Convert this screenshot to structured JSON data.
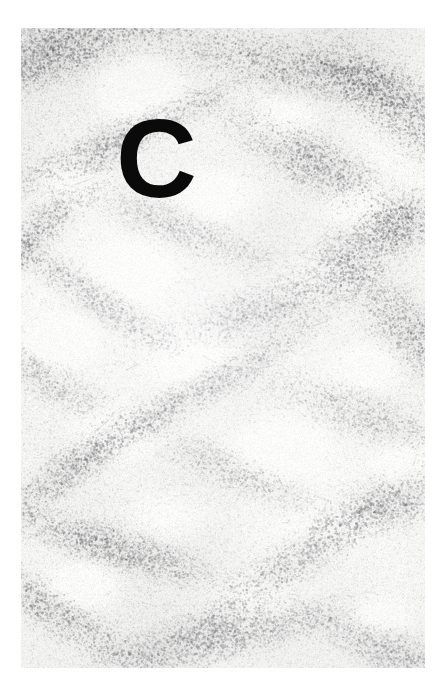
{
  "figure": {
    "domain": "micrograph",
    "panel_label": "C",
    "background_color": "#ffffff",
    "plate": {
      "x": 21,
      "y": 28,
      "width": 404,
      "height": 640,
      "base_color": "#f4f4f3",
      "stipple_color": "#6e6e6e",
      "band_color": "#9a9a9a"
    },
    "label_style": {
      "color": "#0a0a0a",
      "font_size_px": 112,
      "x": 116,
      "y": 104
    }
  },
  "texture": {
    "type": "stipple",
    "seed": 20240517,
    "dot_count": 120000,
    "dot_radius_min": 0.35,
    "dot_radius_max": 1.35,
    "base_alpha": 0.22,
    "bands": [
      {
        "cx": 0.1,
        "cy": 0.03,
        "rx": 0.52,
        "ry": 0.075,
        "rot": -12,
        "strength": 0.85
      },
      {
        "cx": 0.62,
        "cy": 0.055,
        "rx": 0.46,
        "ry": 0.065,
        "rot": 8,
        "strength": 0.7
      },
      {
        "cx": 0.93,
        "cy": 0.12,
        "rx": 0.3,
        "ry": 0.09,
        "rot": 26,
        "strength": 0.75
      },
      {
        "cx": 0.24,
        "cy": 0.175,
        "rx": 0.4,
        "ry": 0.045,
        "rot": -16,
        "strength": 0.8
      },
      {
        "cx": 0.74,
        "cy": 0.215,
        "rx": 0.38,
        "ry": 0.07,
        "rot": 20,
        "strength": 0.72
      },
      {
        "cx": 0.07,
        "cy": 0.3,
        "rx": 0.26,
        "ry": 0.055,
        "rot": -30,
        "strength": 0.68
      },
      {
        "cx": 0.4,
        "cy": 0.315,
        "rx": 0.34,
        "ry": 0.05,
        "rot": 14,
        "strength": 0.6
      },
      {
        "cx": 0.88,
        "cy": 0.33,
        "rx": 0.32,
        "ry": 0.07,
        "rot": -18,
        "strength": 0.78
      },
      {
        "cx": 0.18,
        "cy": 0.42,
        "rx": 0.36,
        "ry": 0.048,
        "rot": 22,
        "strength": 0.7
      },
      {
        "cx": 0.58,
        "cy": 0.445,
        "rx": 0.4,
        "ry": 0.058,
        "rot": -10,
        "strength": 0.66
      },
      {
        "cx": 0.95,
        "cy": 0.47,
        "rx": 0.26,
        "ry": 0.08,
        "rot": 30,
        "strength": 0.64
      },
      {
        "cx": 0.05,
        "cy": 0.545,
        "rx": 0.3,
        "ry": 0.05,
        "rot": 18,
        "strength": 0.62
      },
      {
        "cx": 0.45,
        "cy": 0.565,
        "rx": 0.42,
        "ry": 0.045,
        "rot": -20,
        "strength": 0.74
      },
      {
        "cx": 0.82,
        "cy": 0.6,
        "rx": 0.34,
        "ry": 0.062,
        "rot": 12,
        "strength": 0.58
      },
      {
        "cx": 0.14,
        "cy": 0.68,
        "rx": 0.34,
        "ry": 0.055,
        "rot": -24,
        "strength": 0.7
      },
      {
        "cx": 0.55,
        "cy": 0.7,
        "rx": 0.3,
        "ry": 0.05,
        "rot": 16,
        "strength": 0.6
      },
      {
        "cx": 0.9,
        "cy": 0.745,
        "rx": 0.28,
        "ry": 0.07,
        "rot": -14,
        "strength": 0.72
      },
      {
        "cx": 0.22,
        "cy": 0.81,
        "rx": 0.38,
        "ry": 0.052,
        "rot": 10,
        "strength": 0.76
      },
      {
        "cx": 0.66,
        "cy": 0.84,
        "rx": 0.36,
        "ry": 0.06,
        "rot": -22,
        "strength": 0.68
      },
      {
        "cx": 0.08,
        "cy": 0.91,
        "rx": 0.32,
        "ry": 0.058,
        "rot": 20,
        "strength": 0.74
      },
      {
        "cx": 0.5,
        "cy": 0.95,
        "rx": 0.44,
        "ry": 0.06,
        "rot": -8,
        "strength": 0.8
      },
      {
        "cx": 0.92,
        "cy": 0.975,
        "rx": 0.3,
        "ry": 0.055,
        "rot": 14,
        "strength": 0.7
      }
    ],
    "pale_foci": [
      {
        "cx": 0.3,
        "cy": 0.1,
        "rx": 0.17,
        "ry": 0.075
      },
      {
        "cx": 0.66,
        "cy": 0.14,
        "rx": 0.13,
        "ry": 0.055
      },
      {
        "cx": 0.12,
        "cy": 0.24,
        "rx": 0.14,
        "ry": 0.06
      },
      {
        "cx": 0.5,
        "cy": 0.26,
        "rx": 0.16,
        "ry": 0.065
      },
      {
        "cx": 0.84,
        "cy": 0.275,
        "rx": 0.13,
        "ry": 0.05
      },
      {
        "cx": 0.28,
        "cy": 0.375,
        "rx": 0.17,
        "ry": 0.07
      },
      {
        "cx": 0.7,
        "cy": 0.395,
        "rx": 0.15,
        "ry": 0.06
      },
      {
        "cx": 0.1,
        "cy": 0.49,
        "rx": 0.13,
        "ry": 0.055
      },
      {
        "cx": 0.44,
        "cy": 0.505,
        "rx": 0.18,
        "ry": 0.072
      },
      {
        "cx": 0.86,
        "cy": 0.53,
        "rx": 0.14,
        "ry": 0.058
      },
      {
        "cx": 0.24,
        "cy": 0.63,
        "rx": 0.16,
        "ry": 0.065
      },
      {
        "cx": 0.62,
        "cy": 0.655,
        "rx": 0.17,
        "ry": 0.07
      },
      {
        "cx": 0.94,
        "cy": 0.68,
        "rx": 0.12,
        "ry": 0.055
      },
      {
        "cx": 0.38,
        "cy": 0.76,
        "rx": 0.15,
        "ry": 0.062
      },
      {
        "cx": 0.78,
        "cy": 0.78,
        "rx": 0.16,
        "ry": 0.058
      },
      {
        "cx": 0.16,
        "cy": 0.87,
        "rx": 0.14,
        "ry": 0.055
      },
      {
        "cx": 0.56,
        "cy": 0.89,
        "rx": 0.15,
        "ry": 0.06
      },
      {
        "cx": 0.88,
        "cy": 0.92,
        "rx": 0.13,
        "ry": 0.05
      }
    ]
  }
}
